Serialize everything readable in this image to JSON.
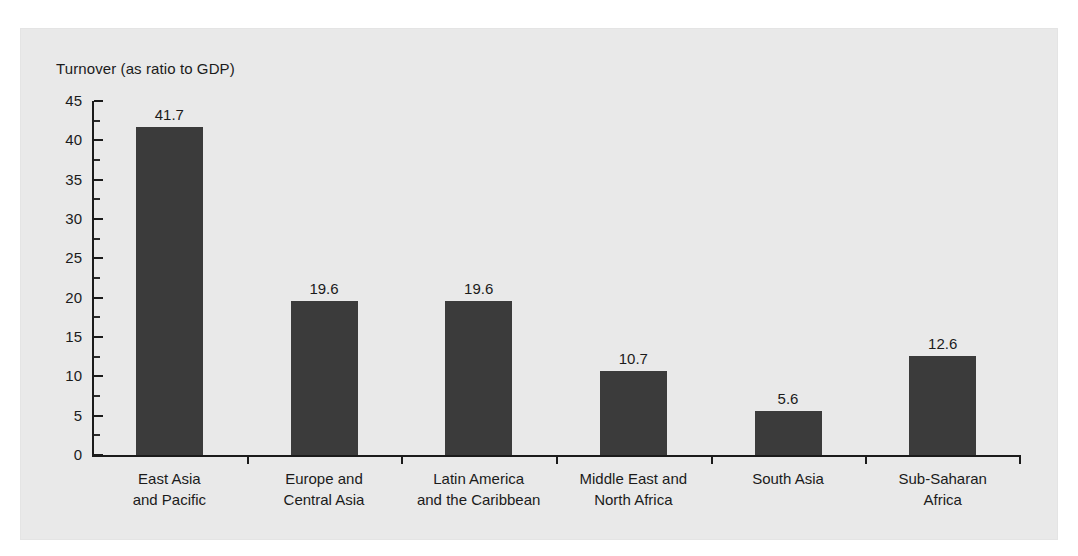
{
  "chart_data": {
    "type": "bar",
    "title": "",
    "ylabel": "Turnover (as ratio to GDP)",
    "xlabel": "",
    "ylim": [
      0,
      45
    ],
    "yticks": [
      0,
      5,
      10,
      15,
      20,
      25,
      30,
      35,
      40,
      45
    ],
    "grid": false,
    "legend": null,
    "categories": [
      "East Asia and Pacific",
      "Europe and Central Asia",
      "Latin America and the Caribbean",
      "Middle East and North Africa",
      "South Asia",
      "Sub-Saharan Africa"
    ],
    "category_lines": [
      [
        "East Asia",
        "and Pacific"
      ],
      [
        "Europe and",
        "Central Asia"
      ],
      [
        "Latin America",
        "and the Caribbean"
      ],
      [
        "Middle East and",
        "North Africa"
      ],
      [
        "South Asia",
        ""
      ],
      [
        "Sub-Saharan",
        "Africa"
      ]
    ],
    "values": [
      41.7,
      19.6,
      19.6,
      10.7,
      5.6,
      12.6
    ],
    "value_labels": [
      "41.7",
      "19.6",
      "19.6",
      "10.7",
      "5.6",
      "12.6"
    ],
    "colors": {
      "bar": "#3b3b3b",
      "panel_background": "#e9e9e9",
      "page_background": "#ffffff",
      "axis": "#1b1b1b",
      "text": "#1b1b1b"
    }
  },
  "axis": {
    "y_tick_labels": [
      "45",
      "40",
      "35",
      "30",
      "25",
      "20",
      "15",
      "10",
      "5",
      "0"
    ]
  }
}
